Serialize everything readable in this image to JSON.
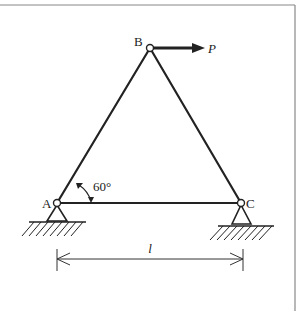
{
  "diagram": {
    "type": "truss-structure",
    "nodes": {
      "A": {
        "label": "A",
        "x": 57,
        "y": 203,
        "support": "pin"
      },
      "B": {
        "label": "B",
        "x": 150,
        "y": 48
      },
      "C": {
        "label": "C",
        "x": 241,
        "y": 203,
        "support": "pin"
      }
    },
    "members": [
      "AB",
      "BC",
      "AC"
    ],
    "load": {
      "label": "P",
      "at": "B",
      "direction": "right"
    },
    "angle": {
      "label": "60°",
      "at": "A"
    },
    "dimension": {
      "label": "l",
      "from": "A",
      "to": "C"
    },
    "colors": {
      "line": "#222222",
      "frame": "#888888",
      "background": "#ffffff"
    }
  }
}
